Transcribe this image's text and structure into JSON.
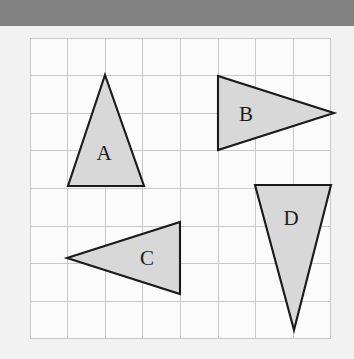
{
  "page": {
    "background_color": "#f2f2f2",
    "width": 354,
    "height": 359
  },
  "top_bar": {
    "color": "#818181",
    "height": 26
  },
  "grid": {
    "origin_x": 30,
    "origin_y": 12,
    "cell_size": 37.6,
    "columns": 8,
    "rows": 8,
    "line_color": "#c9c9c9",
    "cell_fill": "#fbfbfb"
  },
  "style": {
    "shape_fill": "#d8d8d8",
    "shape_stroke": "#1a1a1a",
    "label_color": "#1c1c1c"
  },
  "shapes": [
    {
      "id": "triangle-a",
      "label": "A",
      "points": "105,49 68,160 144,160",
      "label_x": 104,
      "label_y": 127
    },
    {
      "id": "triangle-b",
      "label": "B",
      "points": "218,50 218,124 334,87",
      "label_x": 246,
      "label_y": 88
    },
    {
      "id": "triangle-c",
      "label": "C",
      "points": "67,232 180,196 180,268",
      "label_x": 147,
      "label_y": 232
    },
    {
      "id": "triangle-d",
      "label": "D",
      "points": "255,159 331,159 294,304",
      "label_x": 291,
      "label_y": 192
    }
  ]
}
